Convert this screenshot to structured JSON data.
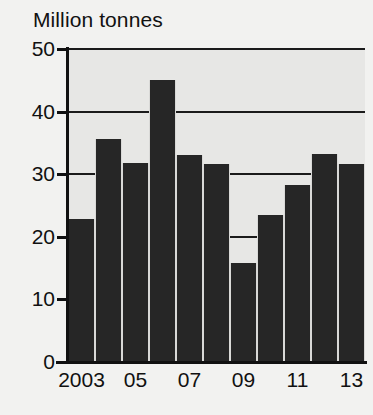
{
  "chart_data": {
    "type": "bar",
    "title": "Million tonnes",
    "xlabel": "",
    "ylabel": "Million tonnes",
    "categories": [
      "2003",
      "2004",
      "2005",
      "2006",
      "2007",
      "2008",
      "2009",
      "2010",
      "2011",
      "2012",
      "2013"
    ],
    "values": [
      22.8,
      35.6,
      31.8,
      45.0,
      33.0,
      31.6,
      15.8,
      23.5,
      28.3,
      33.2,
      31.7
    ],
    "ylim": [
      0,
      50
    ],
    "ytick_values": [
      0,
      10,
      20,
      30,
      40,
      50
    ],
    "ytick_labels": [
      "0",
      "10",
      "20",
      "30",
      "40",
      "50"
    ],
    "xtick_labels": [
      "2003",
      "05",
      "07",
      "09",
      "11",
      "13"
    ],
    "xtick_categories": [
      "2003",
      "2005",
      "2007",
      "2009",
      "2011",
      "2013"
    ],
    "grid": true,
    "legend": false,
    "legend_position": "none",
    "bar_color": "#262626",
    "plot_background": "#e7e7e5",
    "figure_background": "#f2f2f0",
    "axis_color": "#111111"
  }
}
